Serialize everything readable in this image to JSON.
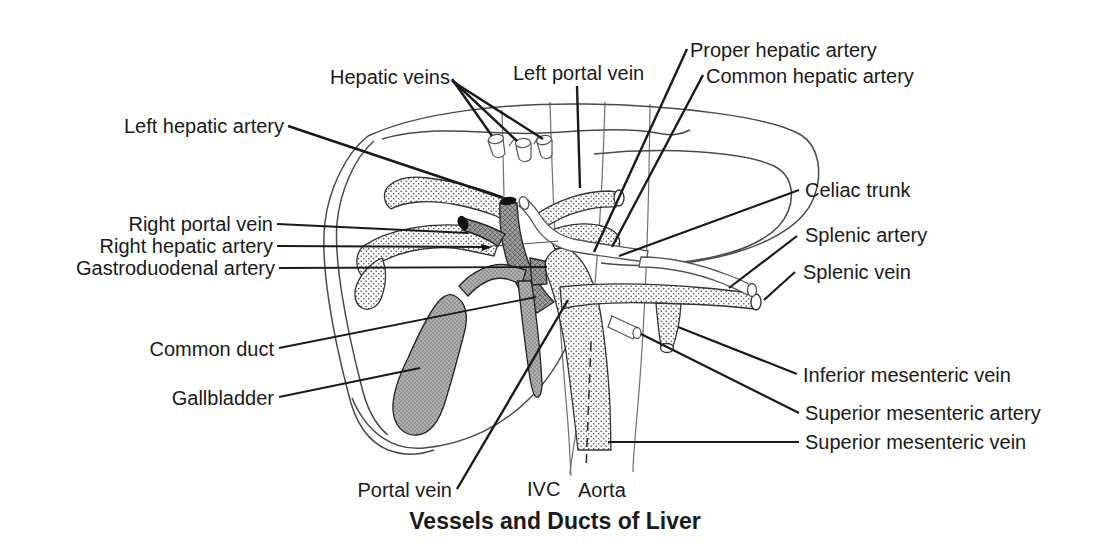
{
  "figure": {
    "title": "Vessels and Ducts of Liver",
    "labels": {
      "hepatic_veins": "Hepatic veins",
      "left_portal_vein": "Left portal vein",
      "proper_hepatic_artery": "Proper hepatic artery",
      "common_hepatic_artery": "Common hepatic artery",
      "left_hepatic_artery": "Left hepatic artery",
      "right_portal_vein": "Right portal vein",
      "right_hepatic_artery": "Right hepatic artery",
      "gastroduodenal_artery": "Gastroduodenal artery",
      "common_duct": "Common duct",
      "gallbladder": "Gallbladder",
      "celiac_trunk": "Celiac trunk",
      "splenic_artery": "Splenic artery",
      "splenic_vein": "Splenic vein",
      "inferior_mesenteric_vein": "Inferior mesenteric vein",
      "superior_mesenteric_artery": "Superior mesenteric artery",
      "superior_mesenteric_vein": "Superior mesenteric vein",
      "portal_vein": "Portal vein",
      "ivc": "IVC",
      "aorta": "Aorta"
    },
    "colors": {
      "ink": "#1a1a1a",
      "outline": "#4a4a4a",
      "stipple_dot": "#444444",
      "gray_fill": "#a9a9a9",
      "dark_fill": "#959595",
      "background": "#ffffff"
    }
  }
}
